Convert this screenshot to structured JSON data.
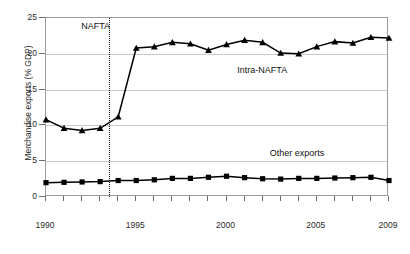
{
  "chart_data": {
    "type": "line",
    "title": "",
    "xlabel": "",
    "ylabel": "Merchandise exports (% GDP)",
    "xlim": [
      1990,
      2009
    ],
    "ylim": [
      0,
      25
    ],
    "ytick_labels": [
      "0",
      "5",
      "10",
      "15",
      "20",
      "25"
    ],
    "ytick_values": [
      0,
      5,
      10,
      15,
      20,
      25
    ],
    "xtick_labels": [
      "1990",
      "1995",
      "2000",
      "2005",
      "2009"
    ],
    "xtick_values": [
      1990,
      1995,
      2000,
      2005,
      2009
    ],
    "grid": "horizontal",
    "legend": "inline-annotations",
    "x": [
      1990,
      1991,
      1992,
      1993,
      1994,
      1995,
      1996,
      1997,
      1998,
      1999,
      2000,
      2001,
      2002,
      2003,
      2004,
      2005,
      2006,
      2007,
      2008,
      2009
    ],
    "series": [
      {
        "name": "Intra-NAFTA",
        "marker": "triangle",
        "color": "#000000",
        "values": [
          10.8,
          9.6,
          9.3,
          9.6,
          11.2,
          20.8,
          21.0,
          21.6,
          21.4,
          20.5,
          21.3,
          21.9,
          21.6,
          20.1,
          20.0,
          21.0,
          21.7,
          21.5,
          22.3,
          22.2
        ]
      },
      {
        "name": "Other exports",
        "marker": "square",
        "color": "#000000",
        "values": [
          2.0,
          2.05,
          2.1,
          2.15,
          2.3,
          2.3,
          2.4,
          2.6,
          2.6,
          2.75,
          2.9,
          2.7,
          2.55,
          2.5,
          2.6,
          2.6,
          2.65,
          2.7,
          2.75,
          2.3
        ]
      }
    ],
    "annotations": [
      {
        "name": "nafta-marker",
        "label": "NAFTA",
        "x": 1993.5,
        "type": "vertical-dotted-line"
      },
      {
        "name": "intra-nafta-label",
        "label": "Intra-NAFTA",
        "x": 2000.6,
        "y": 17.6
      },
      {
        "name": "other-exports-label",
        "label": "Other exports",
        "x": 2002.4,
        "y": 6.0
      }
    ]
  }
}
